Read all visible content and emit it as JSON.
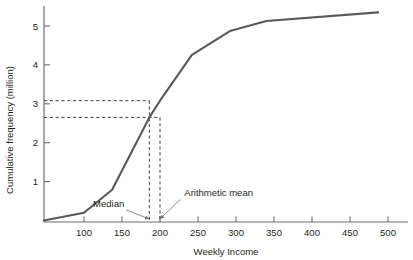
{
  "chart_data": {
    "type": "line",
    "title": "",
    "xlabel": "Weekly Income",
    "ylabel": "Cumulative frequency (million)",
    "xlim": [
      47,
      510
    ],
    "ylim": [
      0,
      5.6
    ],
    "grid": false,
    "legend": "none",
    "x_ticks": [
      100,
      150,
      200,
      250,
      300,
      350,
      400,
      450,
      500
    ],
    "x_tick_labels": [
      "100",
      "150",
      "200",
      "250",
      "300",
      "350",
      "400",
      "450",
      "500"
    ],
    "y_ticks": [
      1,
      2,
      3,
      4,
      5
    ],
    "y_tick_labels": [
      "1",
      "2",
      "3",
      "4",
      "5"
    ],
    "series": [
      {
        "name": "Cumulative frequency",
        "x": [
          47,
          100,
          137,
          186,
          200,
          242,
          292,
          340,
          487
        ],
        "values": [
          0.0,
          0.2,
          0.79,
          2.65,
          3.08,
          4.26,
          4.87,
          5.13,
          5.35
        ]
      }
    ],
    "annotations": [
      {
        "name": "median",
        "label": "Median",
        "x_value": 186,
        "y_value": 2.65,
        "label_x": 112,
        "label_y": 0.35
      },
      {
        "name": "arithmetic-mean",
        "label": "Arithmetic mean",
        "x_value": 200,
        "y_value": 3.08,
        "label_x": 232,
        "label_y": 0.62
      }
    ],
    "guide_lines": {
      "horizontal_values": [
        3.08,
        2.65
      ],
      "vertical_values": [
        186,
        200
      ]
    },
    "colors": {
      "curve": "#58595b",
      "axis": "#6d6e71",
      "text": "#231f20",
      "guide": "#231f20"
    }
  }
}
